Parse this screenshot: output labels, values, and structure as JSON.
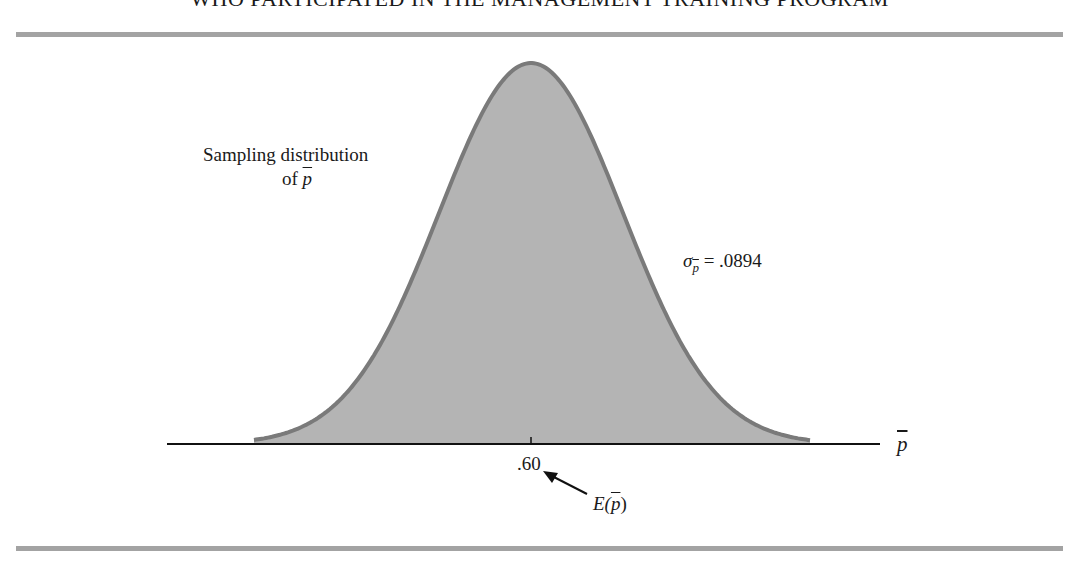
{
  "caption": "WHO PARTICIPATED IN THE MANAGEMENT TRAINING PROGRAM",
  "labels": {
    "distribution_line1": "Sampling distribution",
    "distribution_line2_prefix": "of ",
    "symbol_p": "p",
    "sigma": "σ",
    "sigma_value": "= .0894",
    "tick_value": ".60",
    "expected_prefix": "E(",
    "expected_suffix": ")",
    "axis_label": "p"
  },
  "colors": {
    "fill": "#b4b4b4",
    "curve_stroke": "#7a7a7a",
    "rule": "#a3a3a3",
    "axis": "#111111"
  },
  "chart_data": {
    "type": "area",
    "xlabel": "p̄",
    "ylabel": "",
    "distribution": "normal",
    "mean": 0.6,
    "std_dev": 0.0894,
    "x_ticks": [
      ".60"
    ],
    "annotations": [
      {
        "text": "Sampling distribution of p̄",
        "position": "upper-left"
      },
      {
        "text": "σp̄ = .0894",
        "position": "right of curve"
      },
      {
        "text": "E(p̄)",
        "arrow_to": ".60"
      }
    ],
    "grid": false,
    "legend": "none"
  }
}
